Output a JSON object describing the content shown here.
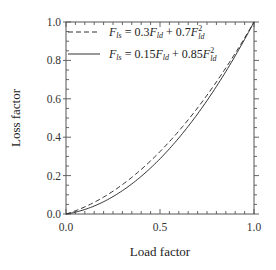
{
  "chart_data": {
    "type": "line",
    "title": "",
    "xlabel": "Load factor",
    "ylabel": "Loss factor",
    "xlim": [
      0.0,
      1.0
    ],
    "ylim": [
      0.0,
      1.0
    ],
    "x_ticks": [
      "0.0",
      "0.5",
      "1.0"
    ],
    "y_ticks": [
      "0.0",
      "0.2",
      "0.4",
      "0.6",
      "0.8",
      "1.0"
    ],
    "grid": false,
    "legend_position": "upper left",
    "series": [
      {
        "name": "F_ls = 0.3F_ld + 0.7F_ld^2",
        "style": "dashed",
        "formula": {
          "a": 0.3,
          "b": 0.7
        },
        "x": [
          0.0,
          0.1,
          0.2,
          0.3,
          0.4,
          0.5,
          0.6,
          0.7,
          0.8,
          0.9,
          1.0
        ],
        "values": [
          0.0,
          0.037,
          0.088,
          0.153,
          0.232,
          0.325,
          0.432,
          0.553,
          0.688,
          0.837,
          1.0
        ]
      },
      {
        "name": "F_ls = 0.15F_ld + 0.85F_ld^2",
        "style": "solid",
        "formula": {
          "a": 0.15,
          "b": 0.85
        },
        "x": [
          0.0,
          0.1,
          0.2,
          0.3,
          0.4,
          0.5,
          0.6,
          0.7,
          0.8,
          0.9,
          1.0
        ],
        "values": [
          0.0,
          0.0235,
          0.064,
          0.1215,
          0.196,
          0.2875,
          0.396,
          0.5215,
          0.664,
          0.8235,
          1.0
        ]
      }
    ]
  },
  "legend": {
    "dashed": {
      "lhs": "F",
      "lhs_sub": "ls",
      "eq": " = 0.3",
      "t1": "F",
      "t1_sub": "ld",
      "plus": " + 0.7",
      "t2": "F",
      "t2_sub": "ld",
      "t2_sup": "2"
    },
    "solid": {
      "lhs": "F",
      "lhs_sub": "ls",
      "eq": " = 0.15",
      "t1": "F",
      "t1_sub": "ld",
      "plus": " + 0.85",
      "t2": "F",
      "t2_sub": "ld",
      "t2_sup": "2"
    }
  }
}
